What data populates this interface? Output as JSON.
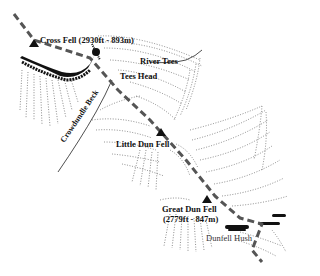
{
  "map": {
    "title": "",
    "colors": {
      "ink": "#111111",
      "path": "#555555",
      "background": "#ffffff"
    },
    "path": {
      "name": "walking-route",
      "style": "dashed",
      "points": [
        [
          14,
          14
        ],
        [
          34,
          40
        ],
        [
          90,
          58
        ],
        [
          118,
          90
        ],
        [
          150,
          120
        ],
        [
          186,
          160
        ],
        [
          215,
          196
        ],
        [
          240,
          218
        ],
        [
          262,
          224
        ],
        [
          252,
          250
        ],
        [
          262,
          262
        ]
      ]
    },
    "summits": [
      {
        "id": "cross-fell",
        "name": "Cross Fell (2930ft - 893m)",
        "x": 34,
        "y": 44
      },
      {
        "id": "little-dun-fell",
        "name": "Little Dun Fell",
        "x": 161,
        "y": 133
      },
      {
        "id": "great-dun-fell",
        "name": "Great Dun Fell",
        "elevation": "(2779ft - 847m)",
        "x": 207,
        "y": 200
      }
    ],
    "labels": {
      "cross_fell": "Cross Fell (2930ft - 893m)",
      "river_tees": "River Tees",
      "tees_head": "Tees Head",
      "crowdundle_beck": "Crowdundle Beck",
      "little_dun_fell": "Little Dun Fell",
      "great_dun_fell": "Great Dun Fell",
      "great_dun_fell_elevation": "(2779ft - 847m)",
      "dunfell_hush": "Dunfell Hush"
    }
  }
}
